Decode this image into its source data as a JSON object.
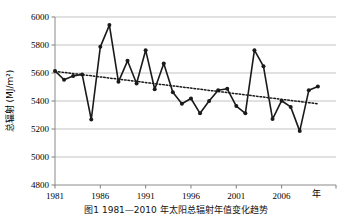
{
  "figure": {
    "caption": "图1 1981—2010 年太阳总辐射年值变化趋势"
  },
  "chart_data": {
    "type": "line",
    "title": "",
    "xlabel": "年",
    "ylabel": "总辐射 (MJ/m²)",
    "ylabel_main": "总辐射",
    "ylabel_unit": "(MJ/m2)",
    "x": [
      1981,
      1982,
      1983,
      1984,
      1985,
      1986,
      1987,
      1988,
      1989,
      1990,
      1991,
      1992,
      1993,
      1994,
      1995,
      1996,
      1997,
      1998,
      1999,
      2000,
      2001,
      2002,
      2003,
      2004,
      2005,
      2006,
      2007,
      2008,
      2009,
      2010
    ],
    "values": [
      5615,
      5552,
      5578,
      5590,
      5268,
      5787,
      5942,
      5537,
      5687,
      5525,
      5763,
      5484,
      5668,
      5462,
      5380,
      5418,
      5312,
      5400,
      5477,
      5487,
      5364,
      5312,
      5763,
      5648,
      5271,
      5402,
      5358,
      5185,
      5476,
      5503
    ],
    "xlim": [
      1981,
      2012
    ],
    "ylim": [
      4800,
      6000
    ],
    "yticks": [
      4800,
      5000,
      5200,
      5400,
      5600,
      5800,
      6000
    ],
    "xticks": [
      1981,
      1986,
      1991,
      1996,
      2001,
      2006
    ],
    "grid": "horizontal",
    "legend": "none",
    "series": [
      {
        "name": "总辐射年值",
        "style": "solid-line-with-markers",
        "color": "#1a1a1a",
        "marker": "filled-circle"
      },
      {
        "name": "线性趋势线",
        "style": "dotted-trendline",
        "color": "#1a1a1a",
        "trend_start_value": 5612,
        "trend_end_value": 5380
      }
    ]
  }
}
